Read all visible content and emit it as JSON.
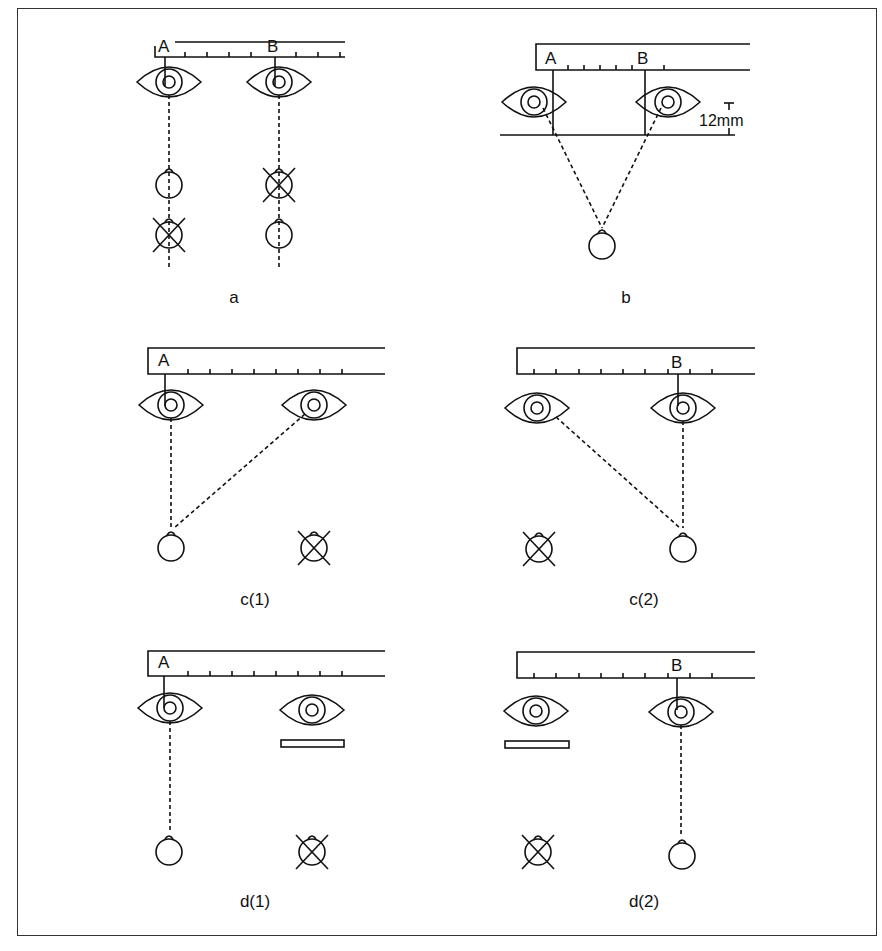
{
  "diagram": {
    "panels": [
      {
        "id": "a",
        "caption": "a",
        "ruler_marks": [
          "A",
          "B"
        ],
        "caption_pos": [
          234,
          298
        ]
      },
      {
        "id": "b",
        "caption": "b",
        "ruler_marks": [
          "A",
          "B"
        ],
        "annotation": "12mm",
        "caption_pos": [
          626,
          298
        ]
      },
      {
        "id": "c1",
        "caption": "c(1)",
        "ruler_marks": [
          "A"
        ],
        "caption_pos": [
          255,
          600
        ]
      },
      {
        "id": "c2",
        "caption": "c(2)",
        "ruler_marks": [
          "B"
        ],
        "caption_pos": [
          644,
          600
        ]
      },
      {
        "id": "d1",
        "caption": "d(1)",
        "ruler_marks": [
          "A"
        ],
        "caption_pos": [
          255,
          902
        ]
      },
      {
        "id": "d2",
        "caption": "d(2)",
        "ruler_marks": [
          "B"
        ],
        "caption_pos": [
          644,
          902
        ]
      }
    ],
    "colors": {
      "line": "#111111",
      "background": "#ffffff",
      "border": "#333333"
    }
  }
}
